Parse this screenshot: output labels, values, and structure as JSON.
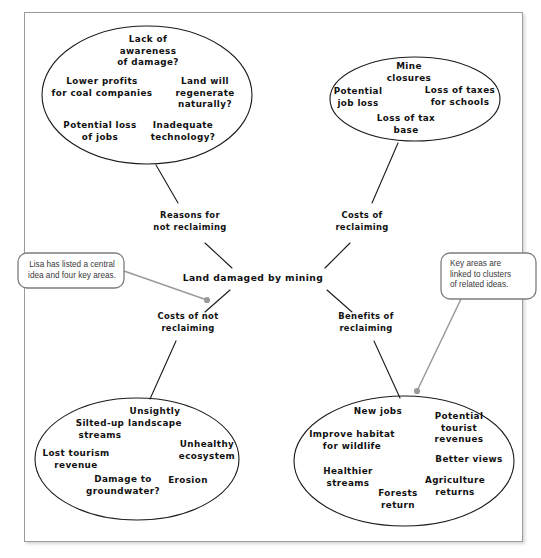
{
  "diagram": {
    "type": "concept-map",
    "central_idea": {
      "label": "Land damaged by mining",
      "x": 253,
      "y": 278
    },
    "key_areas": [
      {
        "id": "reasons-not-reclaiming",
        "label": "Reasons for\nnot reclaiming",
        "x": 190,
        "y": 222
      },
      {
        "id": "costs-reclaiming",
        "label": "Costs of\nreclaiming",
        "x": 362,
        "y": 222
      },
      {
        "id": "costs-not-reclaiming",
        "label": "Costs of not\nreclaiming",
        "x": 188,
        "y": 323
      },
      {
        "id": "benefits-reclaiming",
        "label": "Benefits of\nreclaiming",
        "x": 366,
        "y": 323
      }
    ],
    "clusters": [
      {
        "id": "cluster-reasons-not-reclaiming",
        "linked_key_area": "reasons-not-reclaiming",
        "ellipse": {
          "cx": 147,
          "cy": 95,
          "rx": 105,
          "ry": 69
        },
        "ideas": [
          {
            "label": "Lack of\nawareness\nof damage?",
            "x": 148,
            "y": 51
          },
          {
            "label": "Lower profits\nfor coal companies",
            "x": 102,
            "y": 88
          },
          {
            "label": "Land will\nregenerate\nnaturally?",
            "x": 205,
            "y": 93
          },
          {
            "label": "Potential loss\nof jobs",
            "x": 100,
            "y": 132
          },
          {
            "label": "Inadequate\ntechnology?",
            "x": 183,
            "y": 132
          }
        ]
      },
      {
        "id": "cluster-costs-reclaiming",
        "linked_key_area": "costs-reclaiming",
        "ellipse": {
          "cx": 415,
          "cy": 99,
          "rx": 85,
          "ry": 42
        },
        "ideas": [
          {
            "label": "Mine\nclosures",
            "x": 409,
            "y": 73
          },
          {
            "label": "Potential\njob loss",
            "x": 358,
            "y": 98
          },
          {
            "label": "Loss of taxes\nfor schools",
            "x": 460,
            "y": 97
          },
          {
            "label": "Loss of tax\nbase",
            "x": 406,
            "y": 125
          }
        ]
      },
      {
        "id": "cluster-costs-not-reclaiming",
        "linked_key_area": "costs-not-reclaiming",
        "ellipse": {
          "cx": 137,
          "cy": 459,
          "rx": 102,
          "ry": 61
        },
        "ideas": [
          {
            "label": "Unsightly\nlandscape",
            "x": 155,
            "y": 418
          },
          {
            "label": "Silted-up\nstreams",
            "x": 100,
            "y": 430
          },
          {
            "label": "Unhealthy\necosystem",
            "x": 207,
            "y": 451
          },
          {
            "label": "Lost tourism\nrevenue",
            "x": 76,
            "y": 460
          },
          {
            "label": "Erosion",
            "x": 188,
            "y": 481
          },
          {
            "label": "Damage to\ngroundwater?",
            "x": 123,
            "y": 486
          }
        ]
      },
      {
        "id": "cluster-benefits-reclaiming",
        "linked_key_area": "benefits-reclaiming",
        "ellipse": {
          "cx": 404,
          "cy": 461,
          "rx": 110,
          "ry": 65
        },
        "ideas": [
          {
            "label": "New jobs",
            "x": 378,
            "y": 412
          },
          {
            "label": "Potential\ntourist revenues",
            "x": 459,
            "y": 428
          },
          {
            "label": "Improve habitat\nfor wildlife",
            "x": 352,
            "y": 441
          },
          {
            "label": "Better views",
            "x": 469,
            "y": 460
          },
          {
            "label": "Healthier\nstreams",
            "x": 348,
            "y": 478
          },
          {
            "label": "Agriculture\nreturns",
            "x": 455,
            "y": 487
          },
          {
            "label": "Forests\nreturn",
            "x": 398,
            "y": 500
          }
        ]
      }
    ]
  },
  "callouts": [
    {
      "id": "callout-central-idea",
      "text": "Lisa has listed a central\nidea and four key areas.",
      "box": {
        "x": 18,
        "y": 253,
        "w": 106,
        "h": 35
      },
      "lead_from": {
        "x": 124,
        "y": 271
      },
      "lead_to": {
        "x": 207,
        "y": 300
      }
    },
    {
      "id": "callout-key-areas",
      "text": "Key areas are\nlinked to clusters\nof related ideas.",
      "box": {
        "x": 441,
        "y": 253,
        "w": 95,
        "h": 46
      },
      "lead_from": {
        "x": 461,
        "y": 299
      },
      "lead_to": {
        "x": 417,
        "y": 391
      }
    }
  ],
  "colors": {
    "ink": "#111111",
    "frame_border": "#9b9b9b",
    "callout_border": "#7d7d7d",
    "callout_text": "#3a3a3a",
    "leader": "#9a9a9a",
    "page_background": "#ffffff"
  }
}
